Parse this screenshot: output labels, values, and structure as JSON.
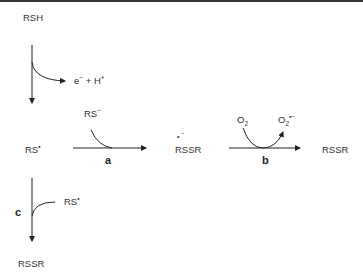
{
  "diagram": {
    "nodes": {
      "rsh": "RSH",
      "rs_radical": "RS",
      "rs_radical_dot": "•",
      "rssr_anion_radical": "RSSR",
      "rssr_anion_radical_mark": "• ‾",
      "rssr_product_b": "RSSR",
      "rssr_product_c": "RSSR"
    },
    "labels": {
      "e": "e",
      "e_sup": "−",
      "plus": "+",
      "h": "H",
      "h_sup": "+",
      "rs_anion": "RS",
      "rs_anion_sup": "−",
      "o2": "O",
      "o2_sub": "2",
      "superoxide": "O",
      "superoxide_sub": "2",
      "superoxide_sup": "•−",
      "rs_radical_c": "RS",
      "rs_radical_c_sup": "•"
    },
    "reactions": {
      "a": "a",
      "b": "b",
      "c": "c"
    }
  }
}
